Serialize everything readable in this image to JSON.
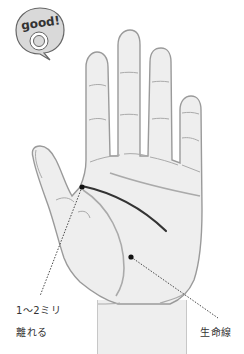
{
  "badge": {
    "text": "good!",
    "icon": "speech-bubble-target-icon"
  },
  "labels": {
    "gap_line1": "1～2ミリ",
    "gap_line2": "離れる",
    "life_line": "生命線"
  },
  "colors": {
    "hand_fill": "#eeeeee",
    "hand_outline": "#999999",
    "palm_line": "#aaaaaa",
    "head_line": "#333333",
    "marker": "#111111",
    "badge_fill": "#d9d9d9",
    "text": "#333333"
  }
}
